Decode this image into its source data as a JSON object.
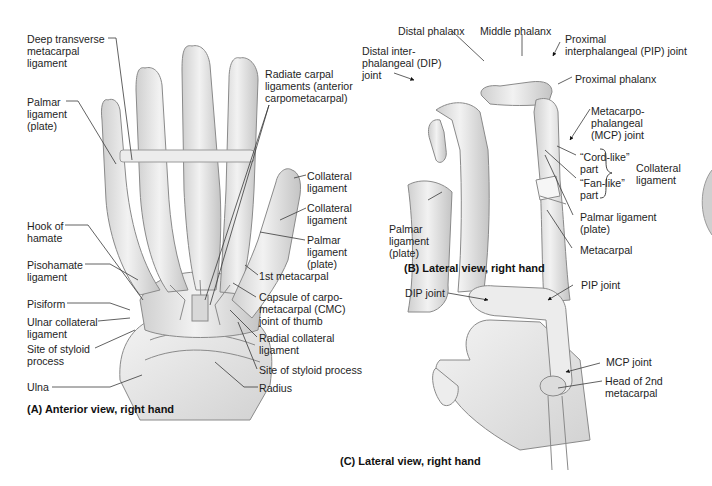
{
  "figure": {
    "panel_a": {
      "caption": "(A) Anterior view, right hand",
      "labels": {
        "deep_transverse": "Deep transverse\nmetacarpal\nligament",
        "palmar_plate": "Palmar\nligament\n(plate)",
        "hook_of_hamate": "Hook of\nhamate",
        "pisohamate": "Pisohamate\nligament",
        "pisiform": "Pisiform",
        "ulnar_collateral": "Ulnar collateral\nligament",
        "site_styloid_ulna": "Site of styloid\nprocess",
        "ulna": "Ulna",
        "radiate_carpal": "Radiate carpal\nligaments (anterior\ncarpometacarpal)",
        "collateral_1": "Collateral\nligament",
        "collateral_2": "Collateral\nligament",
        "palmar_plate_thumb": "Palmar\nligament\n(plate)",
        "first_metacarpal": "1st metacarpal",
        "cmc_capsule": "Capsule of carpo-\nmetacarpal (CMC)\njoint of thumb",
        "radial_collateral": "Radial collateral\nligament",
        "site_styloid_radius": "Site of styloid process",
        "radius": "Radius"
      }
    },
    "panel_b": {
      "caption": "(B) Lateral view, right hand",
      "labels": {
        "distal_phalanx": "Distal phalanx",
        "middle_phalanx": "Middle phalanx",
        "pip_joint": "Proximal\ninterphalangeal (PIP) joint",
        "dip_joint": "Distal inter-\nphalangeal (DIP)\njoint",
        "proximal_phalanx": "Proximal phalanx",
        "mcp_joint": "Metacarpo-\nphalangeal\n(MCP) joint",
        "cord_like": "“Cord-like”\npart",
        "fan_like": "“Fan-like”\npart",
        "collateral": "Collateral\nligament",
        "palmar_plate_left": "Palmar\nligament\n(plate)",
        "palmar_plate_right": "Palmar ligament\n(plate)",
        "metacarpal": "Metacarpal"
      }
    },
    "panel_c": {
      "caption": "(C) Lateral view, right hand",
      "labels": {
        "dip_joint": "DIP joint",
        "pip_joint": "PIP joint",
        "mcp_joint": "MCP joint",
        "head_2nd_metacarpal": "Head of 2nd\nmetacarpal"
      }
    },
    "colors": {
      "bone_fill": "#e6e6e6",
      "bone_stroke": "#8a8a8a",
      "leader": "#3a3a3a",
      "text": "#1e1e1e"
    }
  }
}
